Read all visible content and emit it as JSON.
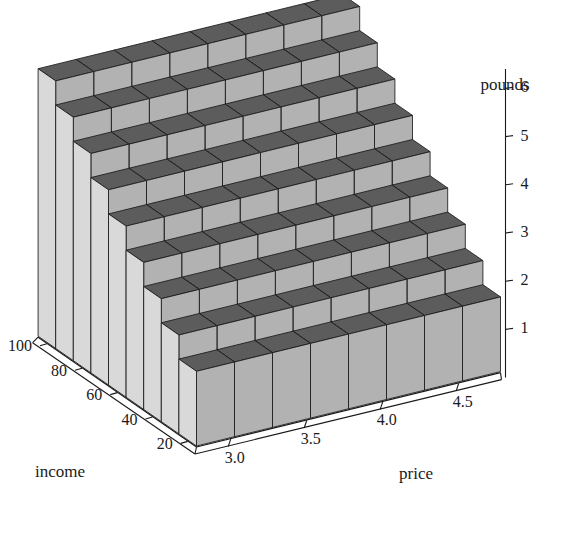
{
  "chart_data": {
    "type": "bar",
    "title": "",
    "subtitle": "",
    "projection": "3d",
    "xlabel": "price",
    "ylabel": "income",
    "zlabel": "pounds",
    "x": [
      2.9,
      3.15,
      3.4,
      3.65,
      3.9,
      4.15,
      4.4,
      4.65
    ],
    "y": [
      20,
      30,
      40,
      50,
      60,
      70,
      80,
      90,
      100
    ],
    "x_ticks": [
      "3.0",
      "3.5",
      "4.0",
      "4.5"
    ],
    "x_tick_values": [
      3.0,
      3.5,
      4.0,
      4.5
    ],
    "y_ticks": [
      "20",
      "40",
      "60",
      "80",
      "100"
    ],
    "y_tick_values": [
      20,
      40,
      60,
      80,
      100
    ],
    "z_ticks": [
      "1",
      "2",
      "3",
      "4",
      "5",
      "6"
    ],
    "z_tick_values": [
      1,
      2,
      3,
      4,
      5,
      6
    ],
    "xlim": [
      2.775,
      4.775
    ],
    "ylim": [
      15,
      105
    ],
    "zlim": [
      0,
      6.4
    ],
    "grid": false,
    "legend": false,
    "n_cols": 8,
    "n_rows": 9,
    "series": [
      {
        "name": "income 20",
        "values": [
          1.55,
          1.55,
          1.55,
          1.55,
          1.55,
          1.55,
          1.55,
          1.55
        ]
      },
      {
        "name": "income 30",
        "values": [
          2.05,
          2.05,
          2.05,
          2.05,
          2.05,
          2.05,
          2.05,
          2.05
        ]
      },
      {
        "name": "income 40",
        "values": [
          2.55,
          2.55,
          2.55,
          2.55,
          2.55,
          2.55,
          2.55,
          2.55
        ]
      },
      {
        "name": "income 50",
        "values": [
          3.05,
          3.05,
          3.05,
          3.05,
          3.05,
          3.05,
          3.05,
          3.05
        ]
      },
      {
        "name": "income 60",
        "values": [
          3.55,
          3.55,
          3.55,
          3.55,
          3.55,
          3.55,
          3.55,
          3.55
        ]
      },
      {
        "name": "income 70",
        "values": [
          4.05,
          4.05,
          4.05,
          4.05,
          4.05,
          4.05,
          4.05,
          4.05
        ]
      },
      {
        "name": "income 80",
        "values": [
          4.55,
          4.55,
          4.55,
          4.55,
          4.55,
          4.55,
          4.55,
          4.55
        ]
      },
      {
        "name": "income 90",
        "values": [
          5.05,
          5.05,
          5.05,
          5.05,
          5.05,
          5.05,
          5.05,
          5.05
        ]
      },
      {
        "name": "income 100",
        "values": [
          5.55,
          5.55,
          5.55,
          5.55,
          5.55,
          5.55,
          5.55,
          5.55
        ]
      }
    ],
    "colors": {
      "bar_top": "#5c5c5c",
      "bar_front": "#b2b2b2",
      "bar_side": "#d9d9d9",
      "edge": "#1a1a1a",
      "axis": "#1a1a1a",
      "background": "#ffffff",
      "text": "#1a1a1a"
    }
  },
  "labels": {
    "pounds": "pounds",
    "income": "income",
    "price": "price"
  }
}
